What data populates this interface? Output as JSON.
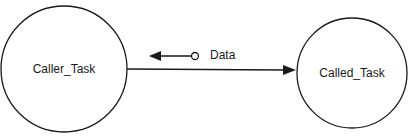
{
  "diagram": {
    "type": "structure-chart",
    "nodes": [
      {
        "id": "caller",
        "label": "Caller_Task",
        "shape": "circle",
        "cx": 64,
        "cy": 69,
        "r": 63
      },
      {
        "id": "called",
        "label": "Called_Task",
        "shape": "circle",
        "cx": 352,
        "cy": 73,
        "r": 55
      }
    ],
    "edges": [
      {
        "from": "caller",
        "to": "called",
        "kind": "call",
        "arrowhead": "filled"
      }
    ],
    "data_couples": [
      {
        "label": "Data",
        "direction": "from called to caller",
        "tail": "open-circle",
        "head": "filled-arrow"
      }
    ],
    "caption": "",
    "colors": {
      "stroke": "#1a1a1a",
      "background": "#ffffff",
      "caption": "#d8d8d8"
    }
  }
}
